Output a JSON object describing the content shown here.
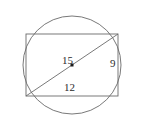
{
  "figure": {
    "background_color": "#ffffff",
    "stroke_color": "#6a6a6a",
    "text_color": "#2b2b2b",
    "width": 143,
    "height": 130
  },
  "chart_data": {
    "type": "diagram",
    "title": "",
    "shapes": [
      {
        "name": "circumscribed-circle",
        "kind": "circle",
        "cx": 72,
        "cy": 65,
        "r": 49,
        "filled": false
      },
      {
        "name": "inscribed-rectangle",
        "kind": "rect",
        "x": 26,
        "y": 34,
        "width": 92,
        "height": 62,
        "filled": false
      },
      {
        "name": "rectangle-diagonal",
        "kind": "line",
        "x1": 26,
        "y1": 96,
        "x2": 118,
        "y2": 34
      },
      {
        "name": "circle-center-marker",
        "kind": "point",
        "cx": 72,
        "cy": 65,
        "size": 3,
        "filled": true
      }
    ],
    "labels": [
      {
        "name": "diagonal-length",
        "text": "15",
        "x": 62,
        "y": 55
      },
      {
        "name": "right-side-length",
        "text": "9",
        "x": 110,
        "y": 58
      },
      {
        "name": "bottom-side-length",
        "text": "12",
        "x": 64,
        "y": 82
      }
    ],
    "annotations": [
      "15 labels the rectangle diagonal, which is a diameter of the circle",
      "9 labels the vertical (right) side of the rectangle",
      "12 labels the horizontal (bottom) side of the rectangle"
    ],
    "grid": false,
    "legend": false
  }
}
